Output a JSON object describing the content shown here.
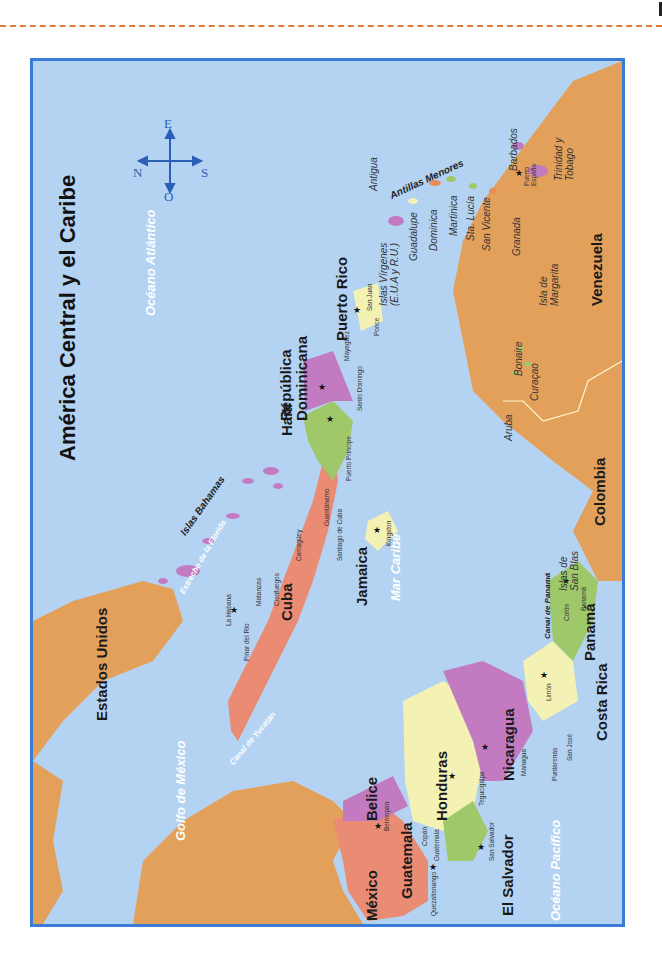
{
  "page": {
    "rule_color": "#e07a3a"
  },
  "map": {
    "title": "América Central y el Caribe",
    "orientation": "rotated 90° (north to the left)",
    "frame_color": "#3a7bd5",
    "water_color": "#b4d3f2",
    "land_color": "#e3a05a",
    "compass": {
      "north": "N",
      "south": "S",
      "east": "E",
      "west": "O"
    },
    "seas": {
      "atlantic": "Océano Atlántico",
      "caribbean": "Mar Caribe",
      "gulf": "Golfo de México",
      "pacific": "Océano Pacífico",
      "florida_strait": "Estrecho de la Florida",
      "yucatan_channel": "Canal de Yucatán",
      "panama_canal": "Canal de Panamá"
    },
    "countries": {
      "usa": "Estados Unidos",
      "mexico": "México",
      "guatemala": "Guatemala",
      "belize": "Belice",
      "honduras": "Honduras",
      "el_salvador": "El Salvador",
      "nicaragua": "Nicaragua",
      "costa_rica": "Costa Rica",
      "panama": "Panamá",
      "colombia": "Colombia",
      "venezuela": "Venezuela",
      "cuba": "Cuba",
      "jamaica": "Jamaica",
      "haiti": "Haití",
      "dominican_republic": "República Dominicana",
      "puerto_rico": "Puerto Rico"
    },
    "islands": {
      "bahamas": "Islas Bahamas",
      "lesser_antilles": "Antillas Menores",
      "virgin_islands": "Islas Vírgenes (E.U.A y R.U.)",
      "antigua": "Antigua",
      "guadalupe": "Guadalupe",
      "dominica": "Dominica",
      "martinica": "Martinica",
      "sta_lucia": "Sta. Lucía",
      "san_vicente": "San Vicente",
      "granada": "Granada",
      "barbados": "Barbados",
      "trinidad": "Trinidad y Tobago",
      "margarita": "Isla de Margarita",
      "aruba": "Aruba",
      "curacao": "Curaçao",
      "bonaire": "Bonaire",
      "san_blas": "Islas de San Blas"
    },
    "cities": {
      "la_habana": "La Habana",
      "pinar": "Pinar del Río",
      "matanzas": "Matanzas",
      "cienfuegos": "Cienfuegos",
      "camaguey": "Camagüey",
      "santiago": "Santiago de Cuba",
      "guantanamo": "Guantánamo",
      "kingston": "Kingston",
      "port_au_prince": "Puerto Príncipe",
      "santo_domingo": "Santo Domingo",
      "mayaguez": "Mayagüez",
      "san_juan": "San Juan",
      "ponce": "Ponce",
      "port_of_spain": "Puerto España",
      "belmopan": "Belmopan",
      "guatemala_city": "Guatemala",
      "quetzaltenango": "Quezaltenango",
      "copan": "Copán",
      "tegucigalpa": "Tegucigalpa",
      "san_salvador": "San Salvador",
      "managua": "Managua",
      "san_jose": "San José",
      "puntarenas": "Puntarenas",
      "limon": "Limón",
      "colon": "Colón",
      "panama_city": "Panamá"
    }
  }
}
